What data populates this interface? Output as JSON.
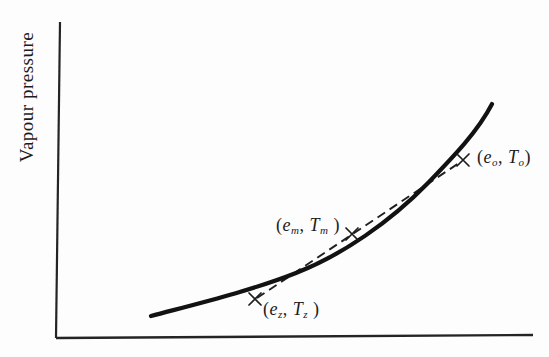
{
  "figure": {
    "ylabel": "Vapour pressure",
    "xlabel": "",
    "ink_color": "#1c1c1c",
    "background_color": "#fdfdfd",
    "points": [
      {
        "name": "z",
        "open": "(",
        "e": "e",
        "e_sub": "z",
        "comma": ", ",
        "T": "T",
        "T_sub": "z",
        "close": " )"
      },
      {
        "name": "m",
        "open": "(",
        "e": "e",
        "e_sub": "m",
        "comma": ", ",
        "T": "T",
        "T_sub": "m",
        "close": " )"
      },
      {
        "name": "o",
        "open": "(",
        "e": "e",
        "e_sub": "o",
        "comma": ", ",
        "T": "T",
        "T_sub": "o",
        "close": ")"
      }
    ]
  },
  "geometry": {
    "y_axis_path": "M60,22 L56,338",
    "x_axis_path": "M56,338 L533,335",
    "curve_path": "M151,316 C200,303 250,291 296,273 C342,255 390,222 428,183 C455,155 478,131 492,104",
    "chord_path": "M257,298 L462,161",
    "marker_z_path": "M249,293 L261,305 M261,293 L249,305",
    "marker_m_path": "M346,228 L358,240 M358,228 L346,240",
    "marker_o_path": "M457,154 L469,166 M469,154 L457,166"
  },
  "chart_data": {
    "type": "line",
    "title": "",
    "xlabel": "",
    "ylabel": "Vapour pressure",
    "grid": false,
    "legend": "none",
    "axes": {
      "x_ticks": [],
      "y_ticks": [],
      "numeric_scales": false
    },
    "series": [
      {
        "name": "vapour-pressure-curve",
        "style": "solid-thick",
        "points_frac": [
          [
            0.2,
            0.07
          ],
          [
            0.3,
            0.11
          ],
          [
            0.42,
            0.16
          ],
          [
            0.5,
            0.21
          ],
          [
            0.6,
            0.3
          ],
          [
            0.7,
            0.42
          ],
          [
            0.78,
            0.49
          ],
          [
            0.85,
            0.6
          ],
          [
            0.91,
            0.74
          ]
        ]
      },
      {
        "name": "chord-line",
        "style": "dashed",
        "points_frac": [
          [
            0.42,
            0.13
          ],
          [
            0.85,
            0.56
          ]
        ]
      }
    ],
    "markers": [
      {
        "label": "(e_z, T_z)",
        "x_frac": 0.42,
        "y_frac": 0.125,
        "symbol": "x"
      },
      {
        "label": "(e_m, T_m)",
        "x_frac": 0.62,
        "y_frac": 0.33,
        "symbol": "x"
      },
      {
        "label": "(e_o, T_o)",
        "x_frac": 0.85,
        "y_frac": 0.56,
        "symbol": "x"
      }
    ]
  }
}
